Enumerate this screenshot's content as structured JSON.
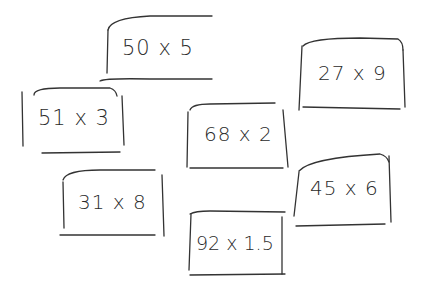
{
  "cards": [
    {
      "id": "c1",
      "text": "50 x 5",
      "x": 113,
      "y": 38,
      "size": 21
    },
    {
      "id": "c2",
      "text": "27 x 9",
      "x": 315,
      "y": 63,
      "size": 20
    },
    {
      "id": "c3",
      "text": "51 x 3",
      "x": 36,
      "y": 107,
      "size": 21
    },
    {
      "id": "c4",
      "text": "68 x 2",
      "x": 204,
      "y": 124,
      "size": 20
    },
    {
      "id": "c5",
      "text": "31 x 8",
      "x": 76,
      "y": 193,
      "size": 20
    },
    {
      "id": "c6",
      "text": "45 x 6",
      "x": 311,
      "y": 180,
      "size": 20
    },
    {
      "id": "c7",
      "text": "92 x 1.5",
      "x": 199,
      "y": 233,
      "size": 19
    }
  ],
  "ink_color": "#2a2a2a",
  "background": "#ffffff"
}
